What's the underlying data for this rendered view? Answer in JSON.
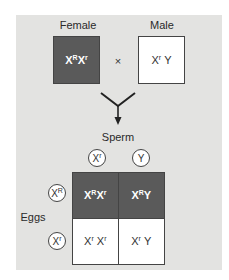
{
  "diagram": {
    "type": "punnett-square",
    "parents": {
      "female": {
        "label": "Female",
        "genotype_base1": "X",
        "genotype_sup1": "R",
        "genotype_base2": "X",
        "genotype_sup2": "r",
        "genotype": "XRXr",
        "color": "#5a5a5a"
      },
      "cross_symbol": "×",
      "male": {
        "label": "Male",
        "genotype_base1": "X",
        "genotype_sup1": "r",
        "genotype_base2": "Y",
        "genotype": "XrY",
        "color": "#ffffff"
      }
    },
    "sperm": {
      "label": "Sperm",
      "alleles": [
        {
          "base": "X",
          "sup": "r",
          "text": "Xr"
        },
        {
          "base": "Y",
          "sup": "",
          "text": "Y"
        }
      ]
    },
    "eggs": {
      "label": "Eggs",
      "alleles": [
        {
          "base": "X",
          "sup": "R",
          "text": "XR"
        },
        {
          "base": "X",
          "sup": "r",
          "text": "Xr"
        }
      ]
    },
    "offspring": [
      [
        {
          "b1": "X",
          "s1": "R",
          "b2": "X",
          "s2": "r",
          "text": "XRXr",
          "shaded": true
        },
        {
          "b1": "X",
          "s1": "R",
          "b2": "Y",
          "s2": "",
          "text": "XRY",
          "shaded": true
        }
      ],
      [
        {
          "b1": "X",
          "s1": "r",
          "b2": "X",
          "s2": "r",
          "text": "XrXr",
          "shaded": false
        },
        {
          "b1": "X",
          "s1": "r",
          "b2": "Y",
          "s2": "",
          "text": "XrY",
          "shaded": false
        }
      ]
    ],
    "colors": {
      "panel_background": "#e3e3e1",
      "shaded_cell": "#5a5a5a",
      "unshaded_cell": "#ffffff",
      "border": "#444444"
    }
  }
}
